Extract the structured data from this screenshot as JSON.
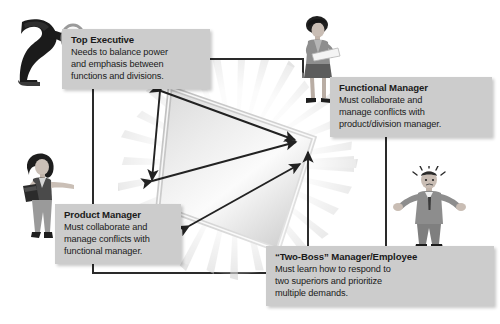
{
  "diagram": {
    "type": "matrix-organization-relationship-diagram",
    "background_color": "#ffffff",
    "callout_bg_color": "#cccccc",
    "callout_text_color": "#1a1a1a",
    "line_color": "#2a2a2a"
  },
  "callouts": [
    {
      "id": "top-executive",
      "title": "Top Executive",
      "body": "Needs to balance power\nand emphasis between\nfunctions and divisions."
    },
    {
      "id": "functional-manager",
      "title": "Functional Manager",
      "body": "Must collaborate and\nmanage conflicts with\nproduct/division manager."
    },
    {
      "id": "product-manager",
      "title": "Product Manager",
      "body": "Must collaborate and\nmanage conflicts with\nfunctional manager."
    },
    {
      "id": "two-boss",
      "title": "“Two-Boss” Manager/Employee",
      "body": "Must learn how to respond to\ntwo superiors and prioritize\nmultiple demands."
    }
  ],
  "figures": [
    {
      "id": "top-executive-figure",
      "icon": "executive-with-magnifier-icon",
      "description": "Dark silhouette of an executive leaning forward holding a magnifying glass"
    },
    {
      "id": "functional-manager-figure",
      "icon": "woman-with-document-icon",
      "description": "Woman standing holding a sheet of paper"
    },
    {
      "id": "product-manager-figure",
      "icon": "woman-with-folder-icon",
      "description": "Woman holding a folder with arm outstretched"
    },
    {
      "id": "two-boss-figure",
      "icon": "stressed-man-shrugging-icon",
      "description": "Man in suit shrugging with arms spread and stress marks above head"
    }
  ],
  "center": {
    "shape": "glowing-diamond",
    "description": "Radiant glowing quadrilateral at the center of the diagram"
  },
  "arrows": [
    {
      "id": "top-exec-to-functional",
      "style": "double-headed",
      "from": "top-executive",
      "to": "functional-manager"
    },
    {
      "id": "functional-to-product",
      "style": "double-headed",
      "from": "functional-manager",
      "to": "product-manager"
    },
    {
      "id": "product-to-two-boss",
      "style": "double-headed",
      "from": "product-manager",
      "to": "two-boss"
    },
    {
      "id": "two-boss-to-functional",
      "style": "double-headed",
      "from": "two-boss",
      "to": "functional-manager"
    }
  ]
}
